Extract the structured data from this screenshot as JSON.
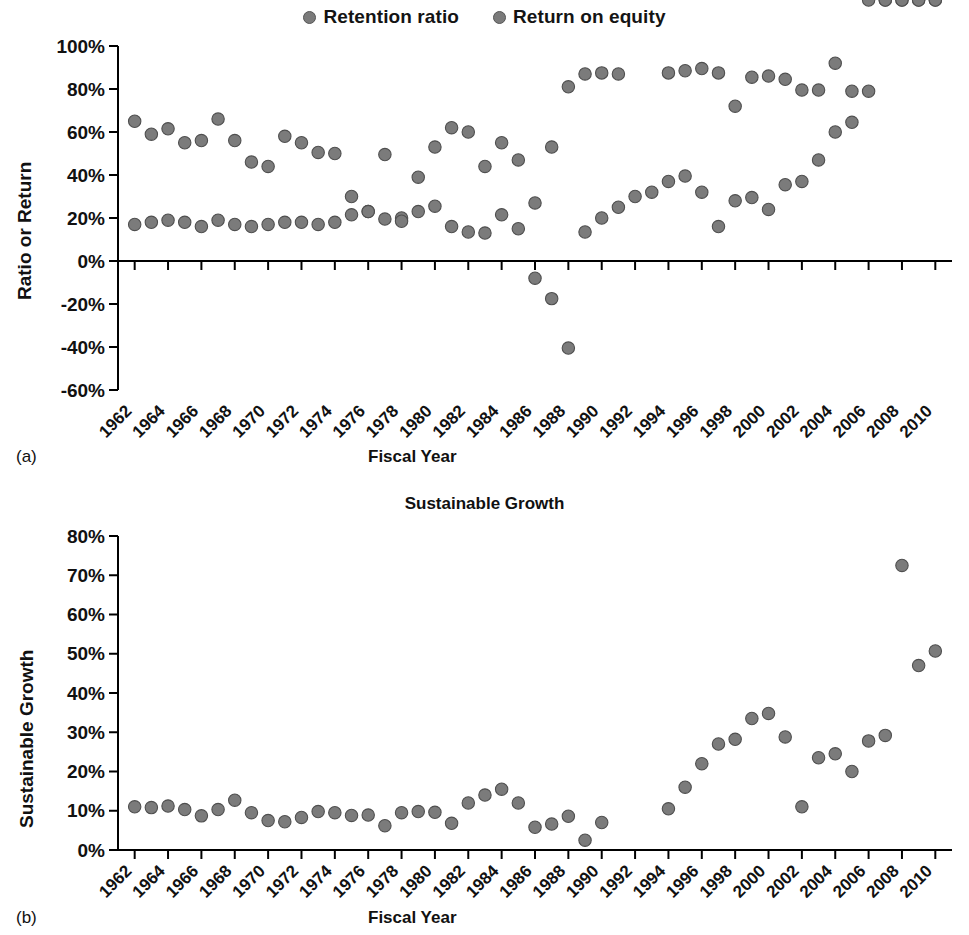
{
  "figure": {
    "legend": [
      {
        "name": "retention-ratio",
        "label": "Retention ratio",
        "color": "#7b7b7b"
      },
      {
        "name": "return-on-equity",
        "label": "Return on equity",
        "color": "#7b7b7b"
      }
    ],
    "panels": [
      {
        "letter": "(a)",
        "xlabel": "Fiscal Year",
        "ylabel": "Ratio or Return",
        "title": ""
      },
      {
        "letter": "(b)",
        "xlabel": "Fiscal Year",
        "ylabel": "Sustainable Growth",
        "title": "Sustainable Growth"
      }
    ]
  },
  "chart_data": [
    {
      "type": "scatter",
      "panel": "(a)",
      "title": "",
      "xlabel": "Fiscal Year",
      "ylabel": "Ratio or Return",
      "xlim": [
        1961,
        2011
      ],
      "ylim": [
        -60,
        100
      ],
      "ytick_labels": [
        "100%",
        "80%",
        "60%",
        "40%",
        "20%",
        "0%",
        "-20%",
        "-40%",
        "-60%"
      ],
      "ytick_values": [
        100,
        80,
        60,
        40,
        20,
        0,
        -20,
        -40,
        -60
      ],
      "xtick_labels": [
        "1962",
        "1964",
        "1966",
        "1968",
        "1970",
        "1972",
        "1974",
        "1976",
        "1978",
        "1980",
        "1982",
        "1984",
        "1986",
        "1988",
        "1990",
        "1992",
        "1994",
        "1996",
        "1998",
        "2000",
        "2002",
        "2004",
        "2006",
        "2008",
        "2010"
      ],
      "xtick_values": [
        1962,
        1964,
        1966,
        1968,
        1970,
        1972,
        1974,
        1976,
        1978,
        1980,
        1982,
        1984,
        1986,
        1988,
        1990,
        1992,
        1994,
        1996,
        1998,
        2000,
        2002,
        2004,
        2006,
        2008,
        2010
      ],
      "grid": false,
      "legend_position": "top-center",
      "series": [
        {
          "name": "Retention ratio",
          "color": "#7b7b7b",
          "x": [
            1962,
            1963,
            1964,
            1965,
            1966,
            1967,
            1968,
            1969,
            1970,
            1971,
            1972,
            1973,
            1974,
            1975,
            1976,
            1977,
            1978,
            1979,
            1980,
            1981,
            1982,
            1983,
            1984,
            1985,
            1986,
            1987,
            1988,
            1989,
            1990,
            1991,
            1994,
            1995,
            1996,
            1997,
            1998,
            1999,
            2000,
            2001,
            2002,
            2003,
            2004,
            2005,
            2006,
            2007,
            2008,
            2009,
            2010
          ],
          "values": [
            65,
            59,
            61.5,
            55,
            56,
            66,
            56,
            46,
            44,
            58,
            55,
            50.5,
            50,
            30,
            23,
            49.5,
            20,
            39,
            53,
            62,
            60,
            44,
            55,
            47,
            27,
            53,
            81,
            87,
            87.5,
            87,
            87.5,
            88.5,
            89.5,
            87.5,
            72,
            85.5,
            86,
            84.5,
            79.5,
            79.5,
            92,
            79,
            79
          ]
        },
        {
          "name": "Return on equity",
          "color": "#7b7b7b",
          "x": [
            1962,
            1963,
            1964,
            1965,
            1966,
            1967,
            1968,
            1969,
            1970,
            1971,
            1972,
            1973,
            1974,
            1975,
            1976,
            1977,
            1978,
            1979,
            1980,
            1981,
            1982,
            1983,
            1984,
            1985,
            1986,
            1987,
            1988,
            1989,
            1990,
            1991,
            1992,
            1993,
            1994,
            1995,
            1996,
            1997,
            1998,
            1999,
            2000,
            2001,
            2002,
            2003,
            2004,
            2005,
            2006,
            2007,
            2008,
            2009,
            2010
          ],
          "values": [
            17,
            18,
            19,
            18,
            16,
            19,
            17,
            16,
            17,
            18,
            18,
            17,
            18,
            21.5,
            23,
            19.5,
            18.5,
            23,
            25.5,
            16,
            13.5,
            13,
            21.5,
            15,
            -8,
            -17.5,
            -40.5,
            13.5,
            20,
            25,
            30,
            32,
            37,
            39.5,
            32,
            16,
            28,
            29.5,
            24,
            35.5,
            37,
            47,
            60,
            64.5
          ]
        }
      ]
    },
    {
      "type": "scatter",
      "panel": "(b)",
      "title": "Sustainable Growth",
      "xlabel": "Fiscal Year",
      "ylabel": "Sustainable Growth",
      "xlim": [
        1961,
        2011
      ],
      "ylim": [
        0,
        80
      ],
      "ytick_labels": [
        "80%",
        "70%",
        "60%",
        "50%",
        "40%",
        "30%",
        "20%",
        "10%",
        "0%"
      ],
      "ytick_values": [
        80,
        70,
        60,
        50,
        40,
        30,
        20,
        10,
        0
      ],
      "xtick_labels": [
        "1962",
        "1964",
        "1966",
        "1968",
        "1970",
        "1972",
        "1974",
        "1976",
        "1978",
        "1980",
        "1982",
        "1984",
        "1986",
        "1988",
        "1990",
        "1992",
        "1994",
        "1996",
        "1998",
        "2000",
        "2002",
        "2004",
        "2006",
        "2008",
        "2010"
      ],
      "xtick_values": [
        1962,
        1964,
        1966,
        1968,
        1970,
        1972,
        1974,
        1976,
        1978,
        1980,
        1982,
        1984,
        1986,
        1988,
        1990,
        1992,
        1994,
        1996,
        1998,
        2000,
        2002,
        2004,
        2006,
        2008,
        2010
      ],
      "grid": false,
      "legend_position": "none",
      "series": [
        {
          "name": "Sustainable growth",
          "color": "#7b7b7b",
          "x": [
            1962,
            1963,
            1964,
            1965,
            1966,
            1967,
            1968,
            1969,
            1970,
            1971,
            1972,
            1973,
            1974,
            1975,
            1976,
            1977,
            1978,
            1979,
            1980,
            1981,
            1982,
            1983,
            1984,
            1985,
            1986,
            1987,
            1988,
            1989,
            1990,
            1994,
            1995,
            1996,
            1997,
            1998,
            1999,
            2000,
            2001,
            2002,
            2003,
            2004,
            2005,
            2006,
            2007,
            2008,
            2009,
            2010
          ],
          "values": [
            11,
            10.8,
            11.2,
            10.3,
            8.7,
            10.3,
            12.7,
            9.5,
            7.5,
            7.2,
            8.3,
            9.8,
            9.5,
            8.8,
            8.9,
            6.2,
            9.5,
            9.8,
            9.6,
            6.8,
            12,
            14,
            15.5,
            12,
            5.8,
            6.6,
            8.6,
            2.5,
            7,
            10.5,
            16,
            22,
            27,
            28.2,
            33.5,
            34.8,
            28.8,
            11,
            23.5,
            24.5,
            20,
            27.8,
            29.2,
            72.5,
            47,
            50.7
          ]
        }
      ]
    }
  ]
}
